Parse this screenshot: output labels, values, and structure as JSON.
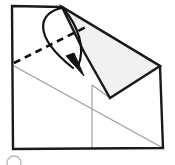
{
  "figure": {
    "type": "origami-fold-diagram",
    "canvas": {
      "width": 175,
      "height": 165,
      "background": "#ffffff"
    },
    "colors": {
      "outline": "#1a1a1a",
      "fold_line_dashed": "#111111",
      "guide_line": "#9a9a9a",
      "shaded_fill": "#f1f1f1",
      "shaded_stroke": "#1a1a1a",
      "arrow": "#111111",
      "step_marker": "#b8b8b8"
    },
    "paper_outline": {
      "name": "square-sheet-outline",
      "points": "12,6 62,7 160,66 163,148 13,149",
      "top_left": "12,6",
      "top_apex": "62,7",
      "right": "160,66",
      "bottom_right": "163,148",
      "bottom_left": "13,149",
      "stroke_width": 2.4
    },
    "shaded_flap": {
      "name": "folded-flap",
      "points": "62,7 160,66 110,98 84,52",
      "fill": "#f1f1f1",
      "stroke_width": 2.4,
      "description": "light gray folded triangular flap lifted toward upper right"
    },
    "dashed_fold_line": {
      "name": "valley-fold-crease",
      "from": "14,63",
      "to": "88,26",
      "dash_pattern": "7 5",
      "stroke_width": 2.6
    },
    "guide_lines": [
      {
        "name": "diagonal-guide-crease",
        "from": "14,66",
        "to": "163,148",
        "stroke_width": 1.1
      },
      {
        "name": "vertical-guide-crease",
        "from": "92,85",
        "to": "92,148",
        "stroke_width": 1.1
      },
      {
        "name": "flap-lower-edge-guide",
        "from": "92,85",
        "to": "110,98",
        "stroke_width": 1.1
      }
    ],
    "arrows": [
      {
        "name": "fold-arrow-outer",
        "path": "M 62,8 C 40,12 30,34 73,68",
        "has_head": true,
        "head_points": "66,56 84,76 74,53",
        "stroke_width": 2.2
      },
      {
        "name": "fold-arrow-inner",
        "path": "M 63,8 C 78,26 86,48 78,66",
        "has_head": false,
        "stroke_width": 2.2
      }
    ],
    "step_marker": {
      "name": "step-number-circle",
      "cx": 14,
      "cy": 163,
      "r": 7,
      "label": "",
      "clipped": true
    }
  }
}
